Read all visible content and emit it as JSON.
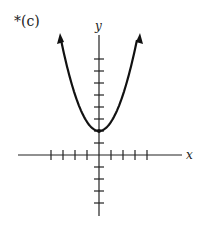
{
  "figure_label": "*(c)",
  "chart_data": {
    "type": "line",
    "title": "*(c)",
    "xlabel": "x",
    "ylabel": "y",
    "function": "parabola opening upward, vertex at (0, 2)",
    "vertex": [
      0,
      2
    ],
    "x_ticks": [
      -4,
      -3,
      -2,
      -1,
      1,
      2,
      3,
      4
    ],
    "y_ticks": [
      -4,
      -3,
      -2,
      -1,
      1,
      2,
      3,
      4,
      5,
      6,
      7,
      8
    ],
    "xlim": [
      -7,
      7
    ],
    "ylim": [
      -5,
      10
    ],
    "grid": false,
    "arrows_on_curve": true
  }
}
